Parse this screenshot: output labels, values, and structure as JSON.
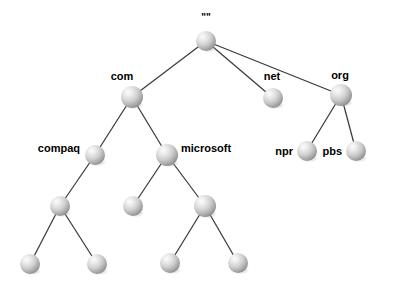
{
  "diagram": {
    "type": "tree",
    "background_color": "#ffffff",
    "edge_color": "#3a3a3a",
    "node_fill_light": "#f2f2f2",
    "node_fill_mid": "#c9c9c9",
    "node_fill_dark": "#8f8f8f",
    "label_color": "#000000",
    "nodes": [
      {
        "id": "root",
        "label": "\"\"",
        "x": 206,
        "y": 41,
        "r": 10,
        "label_x": 206,
        "label_y": 21,
        "label_anchor": "middle",
        "labeled": true
      },
      {
        "id": "com",
        "label": "com",
        "x": 132,
        "y": 97,
        "r": 11,
        "label_x": 122,
        "label_y": 80,
        "label_anchor": "middle",
        "labeled": true
      },
      {
        "id": "net",
        "label": "net",
        "x": 273,
        "y": 98,
        "r": 10,
        "label_x": 272,
        "label_y": 80,
        "label_anchor": "middle",
        "labeled": true
      },
      {
        "id": "org",
        "label": "org",
        "x": 341,
        "y": 95,
        "r": 11,
        "label_x": 340,
        "label_y": 79,
        "label_anchor": "middle",
        "labeled": true
      },
      {
        "id": "compaq",
        "label": "compaq",
        "x": 95,
        "y": 155,
        "r": 10,
        "label_x": 80,
        "label_y": 152,
        "label_anchor": "end",
        "labeled": true
      },
      {
        "id": "microsoft",
        "label": "microsoft",
        "x": 167,
        "y": 155,
        "r": 11,
        "label_x": 181,
        "label_y": 152,
        "label_anchor": "start",
        "labeled": true
      },
      {
        "id": "npr",
        "label": "npr",
        "x": 307,
        "y": 151,
        "r": 10,
        "label_x": 293,
        "label_y": 155,
        "label_anchor": "end",
        "labeled": true
      },
      {
        "id": "pbs",
        "label": "pbs",
        "x": 356,
        "y": 151,
        "r": 10,
        "label_x": 342,
        "label_y": 155,
        "label_anchor": "end",
        "labeled": true
      },
      {
        "id": "compaq-child",
        "label": "",
        "x": 60,
        "y": 206,
        "r": 10,
        "labeled": false
      },
      {
        "id": "ms-child-left",
        "label": "",
        "x": 133,
        "y": 206,
        "r": 10,
        "labeled": false
      },
      {
        "id": "ms-child-right",
        "label": "",
        "x": 205,
        "y": 206,
        "r": 11,
        "labeled": false
      },
      {
        "id": "leaf-1",
        "label": "",
        "x": 30,
        "y": 264,
        "r": 10,
        "labeled": false
      },
      {
        "id": "leaf-2",
        "label": "",
        "x": 97,
        "y": 264,
        "r": 10,
        "labeled": false
      },
      {
        "id": "leaf-3",
        "label": "",
        "x": 170,
        "y": 263,
        "r": 10,
        "labeled": false
      },
      {
        "id": "leaf-4",
        "label": "",
        "x": 238,
        "y": 263,
        "r": 10,
        "labeled": false
      }
    ],
    "edges": [
      {
        "from": "root",
        "to": "com"
      },
      {
        "from": "root",
        "to": "net"
      },
      {
        "from": "root",
        "to": "org"
      },
      {
        "from": "com",
        "to": "compaq"
      },
      {
        "from": "com",
        "to": "microsoft"
      },
      {
        "from": "org",
        "to": "npr"
      },
      {
        "from": "org",
        "to": "pbs"
      },
      {
        "from": "compaq",
        "to": "compaq-child"
      },
      {
        "from": "microsoft",
        "to": "ms-child-left"
      },
      {
        "from": "microsoft",
        "to": "ms-child-right"
      },
      {
        "from": "compaq-child",
        "to": "leaf-1"
      },
      {
        "from": "compaq-child",
        "to": "leaf-2"
      },
      {
        "from": "ms-child-right",
        "to": "leaf-3"
      },
      {
        "from": "ms-child-right",
        "to": "leaf-4"
      }
    ]
  }
}
